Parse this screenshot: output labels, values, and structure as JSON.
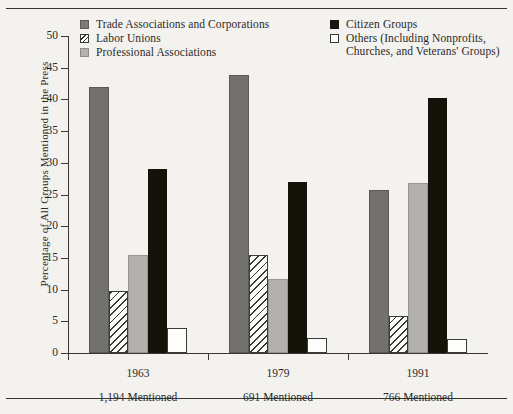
{
  "chart_data": {
    "type": "bar",
    "title": "",
    "xlabel": "",
    "ylabel": "Percentage of All Groups Mentioned in the Press",
    "ylim": [
      0,
      50
    ],
    "yticks": [
      0,
      5,
      10,
      15,
      20,
      25,
      30,
      35,
      40,
      45,
      50
    ],
    "ytick_labels": [
      "0",
      "5",
      "10",
      "15",
      "20",
      "25",
      "30",
      "35",
      "40",
      "45",
      "50"
    ],
    "grid": false,
    "legend_position": "top",
    "categories": [
      "1963",
      "1979",
      "1991"
    ],
    "category_sublabels": [
      "1,194 Mentioned",
      "691 Mentioned",
      "766 Mentioned"
    ],
    "series": [
      {
        "name": "Trade Associations and Corporations",
        "swatch": "sw-trade",
        "bar_class": "b-trade",
        "color": "#737170",
        "values": [
          42.0,
          43.8,
          25.7
        ]
      },
      {
        "name": "Labor Unions",
        "swatch": "sw-labor",
        "bar_class": "b-labor",
        "color": "#ffffff",
        "values": [
          9.8,
          15.5,
          5.8
        ]
      },
      {
        "name": "Professional Associations",
        "swatch": "sw-prof",
        "bar_class": "b-prof",
        "color": "#b3b1ad",
        "values": [
          15.5,
          11.7,
          26.8
        ]
      },
      {
        "name": "Citizen Groups",
        "swatch": "sw-citizen",
        "bar_class": "b-citizen",
        "color": "#151309",
        "values": [
          29.0,
          27.0,
          40.2
        ]
      },
      {
        "name": "Others (Including Nonprofits, Churches, and Veterans' Groups)",
        "swatch": "sw-others",
        "bar_class": "b-others",
        "color": "#fdfdfb",
        "values": [
          4.0,
          2.3,
          2.2
        ]
      }
    ]
  },
  "legend": {
    "left_items": [
      {
        "label": "Trade Associations and Corporations",
        "swatch": "sw-trade"
      },
      {
        "label": "Labor Unions",
        "swatch": "sw-labor"
      },
      {
        "label": "Professional Associations",
        "swatch": "sw-prof"
      }
    ],
    "right_items": [
      {
        "label": "Citizen Groups",
        "swatch": "sw-citizen",
        "line2": ""
      },
      {
        "label": "Others (Including Nonprofits,",
        "swatch": "sw-others",
        "line2": "Churches, and Veterans' Groups)"
      }
    ]
  }
}
